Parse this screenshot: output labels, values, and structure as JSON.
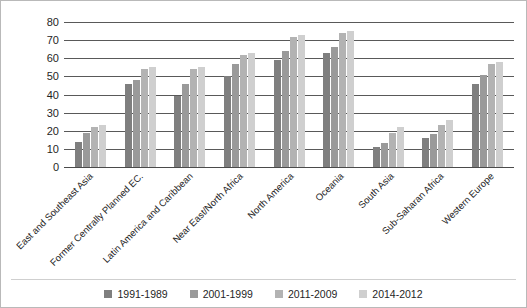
{
  "chart_data": {
    "type": "bar",
    "title": "",
    "xlabel": "",
    "ylabel": "% Population with BMI >25",
    "ylim": [
      0,
      80
    ],
    "ytick_step": 10,
    "yticks": [
      80,
      70,
      60,
      50,
      40,
      30,
      20,
      10,
      0
    ],
    "grid": true,
    "legend_position": "bottom-center",
    "categories": [
      "East and Southeast Asia",
      "Former Centrally Planned EC.",
      "Latin America and Caribbean",
      "Near East/North Africa",
      "North America",
      "Oceania",
      "South Asia",
      "Sub-Saharan Africa",
      "Western Europe"
    ],
    "series": [
      {
        "name": "1991-1989",
        "color": "#7f7f7f",
        "values": [
          14,
          46,
          39,
          50,
          59,
          63,
          11,
          16,
          46
        ]
      },
      {
        "name": "2001-1999",
        "color": "#9a9a9a",
        "values": [
          19,
          48,
          46,
          57,
          64,
          66,
          13,
          18,
          51
        ]
      },
      {
        "name": "2011-2009",
        "color": "#b3b3b3",
        "values": [
          22,
          54,
          54,
          62,
          72,
          74,
          19,
          23,
          57
        ]
      },
      {
        "name": "2014-2012",
        "color": "#cfcfcf",
        "values": [
          23,
          55,
          55,
          63,
          73,
          75,
          22,
          26,
          58
        ]
      }
    ]
  }
}
